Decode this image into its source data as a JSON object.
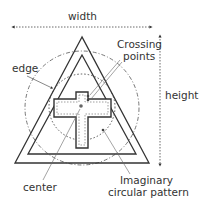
{
  "labels": {
    "width": "width",
    "height": "height",
    "edge": "edge",
    "crossing_points_line1": "Crossing",
    "crossing_points_line2": "points",
    "center": "center",
    "imaginary_line1": "Imaginary",
    "imaginary_line2": "circular pattern"
  },
  "colors": {
    "stroke": "#333333",
    "dashed": "#555555",
    "background": "#ffffff"
  }
}
